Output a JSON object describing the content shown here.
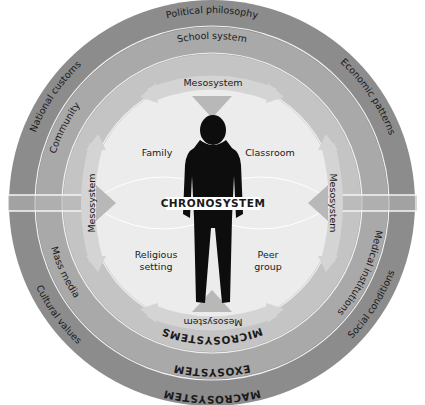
{
  "diagram": {
    "colors": {
      "macrosystem": "#8c8c8c",
      "exosystem": "#a9a9a9",
      "microsystem_ring": "#c4c4c4",
      "inner": "#ececec",
      "arrow": "#d0d0d0",
      "arrow_wedge": "#b8b8b8",
      "separator": "#f4f4f4",
      "silhouette": "#0d0d0d"
    },
    "center_label": "CHRONOSYSTEM",
    "rings": {
      "macrosystem": {
        "label": "MACROSYSTEM",
        "items": [
          "Political philosophy",
          "Economic patterns",
          "Social conditions",
          "Cultural values",
          "National customs"
        ]
      },
      "exosystem": {
        "label": "EXOSYSTEM",
        "items": [
          "School system",
          "Medical institutions",
          "Mass media",
          "Community"
        ]
      },
      "microsystems": {
        "label": "MICROSYSTEMS",
        "items": [
          "Family",
          "Classroom",
          "Religious setting",
          "Peer group"
        ],
        "item_lines": {
          "family": "Family",
          "classroom": "Classroom",
          "religious_1": "Religious",
          "religious_2": "setting",
          "peer_1": "Peer",
          "peer_2": "group"
        }
      },
      "mesosystem": {
        "label": "Mesosystem",
        "arrows": [
          "top",
          "right",
          "bottom",
          "left"
        ]
      }
    }
  }
}
